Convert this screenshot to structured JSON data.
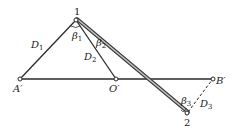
{
  "diagram": {
    "points": {
      "p1": {
        "label": "1",
        "x": 76,
        "y": 20
      },
      "a": {
        "label": "A′",
        "x": 20,
        "y": 79
      },
      "o": {
        "label": "O′",
        "x": 116,
        "y": 79
      },
      "b": {
        "label": "B′",
        "x": 213,
        "y": 79
      },
      "p2": {
        "label": "2",
        "x": 187,
        "y": 113
      }
    },
    "labels": {
      "d1": {
        "main": "D",
        "sub": "1"
      },
      "d2": {
        "main": "D",
        "sub": "2"
      },
      "d3": {
        "main": "D",
        "sub": "3"
      },
      "beta1": {
        "main": "β",
        "sub": "1"
      },
      "beta2": {
        "main": "β",
        "sub": "2"
      },
      "beta3": {
        "main": "β",
        "sub": "3"
      }
    },
    "colors": {
      "line": "#2a2a2a",
      "double_line_fill": "#bdbdbd",
      "background": "#ffffff"
    }
  }
}
